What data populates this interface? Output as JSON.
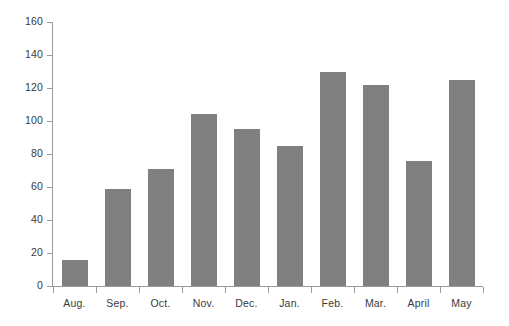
{
  "chart_data": {
    "type": "bar",
    "title": "",
    "subtitle": "",
    "xlabel": "",
    "ylabel": "",
    "categories": [
      "Aug.",
      "Sep.",
      "Oct.",
      "Nov.",
      "Dec.",
      "Jan.",
      "Feb.",
      "Mar.",
      "April",
      "May"
    ],
    "values": [
      16,
      59,
      71,
      104,
      95,
      85,
      130,
      122,
      76,
      125
    ],
    "ylim": [
      0,
      160
    ],
    "yticks": [
      0,
      20,
      40,
      60,
      80,
      100,
      120,
      140,
      160
    ],
    "ytick_labels": [
      "0",
      "20",
      "40",
      "60",
      "80",
      "100",
      "120",
      "140",
      "160"
    ],
    "grid": false,
    "legend": null,
    "legend_position": "none",
    "bar_color": "#808080",
    "axis_color": "#9a9a9a",
    "text_color": "#3a3a3a",
    "background_color": "#ffffff"
  }
}
